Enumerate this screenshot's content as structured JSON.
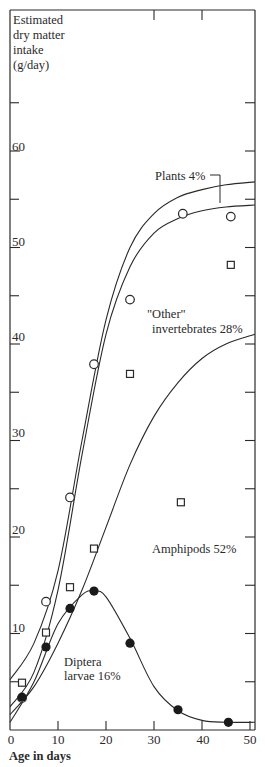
{
  "chart_data": {
    "type": "scatter",
    "title": "",
    "xlabel": "Age in days",
    "ylabel": "Estimated dry matter intake (g/day)",
    "ylabel_lines": [
      "Estimated",
      "dry matter",
      "intake",
      "(g/day)"
    ],
    "xlim": [
      0,
      51
    ],
    "ylim": [
      0,
      74
    ],
    "x_ticks": [
      0,
      10,
      20,
      30,
      40,
      50
    ],
    "y_ticks": [
      10,
      20,
      30,
      40,
      50,
      60
    ],
    "y_minor_ticks": [
      5,
      15,
      25,
      35,
      45,
      55,
      65
    ],
    "grid": false,
    "legend_position": "inline annotations",
    "series": [
      {
        "name": "Total (cumulative, incl. Plants)",
        "marker": "open-circle",
        "points": [
          [
            2.5,
            3.3
          ],
          [
            7.5,
            13.3
          ],
          [
            12.5,
            24.1
          ],
          [
            17.5,
            37.9
          ],
          [
            25,
            44.6
          ],
          [
            36,
            53.5
          ],
          [
            46,
            53.2
          ]
        ],
        "curve": [
          [
            0,
            5.2
          ],
          [
            5,
            9.0
          ],
          [
            10,
            16.5
          ],
          [
            15,
            30.0
          ],
          [
            20,
            42.5
          ],
          [
            25,
            50.0
          ],
          [
            30,
            53.5
          ],
          [
            35,
            55.2
          ],
          [
            40,
            56.0
          ],
          [
            45,
            56.5
          ],
          [
            51,
            56.8
          ]
        ]
      },
      {
        "name": "Cumulative excl. Plants",
        "marker": "none",
        "points": [],
        "curve": [
          [
            0,
            2.4
          ],
          [
            5,
            6.0
          ],
          [
            10,
            14.5
          ],
          [
            15,
            28.5
          ],
          [
            20,
            41.0
          ],
          [
            25,
            48.0
          ],
          [
            30,
            51.5
          ],
          [
            35,
            53.0
          ],
          [
            40,
            53.8
          ],
          [
            45,
            54.2
          ],
          [
            51,
            54.4
          ]
        ]
      },
      {
        "name": "Diptera + Amphipods (cumulative, open squares)",
        "marker": "open-square",
        "points": [
          [
            2.5,
            4.9
          ],
          [
            7.5,
            10.1
          ],
          [
            12.5,
            14.8
          ],
          [
            17.5,
            18.8
          ],
          [
            25,
            36.9
          ],
          [
            35.6,
            23.6
          ],
          [
            46,
            48.2
          ]
        ],
        "curve": [
          [
            0,
            1.6
          ],
          [
            5,
            4.5
          ],
          [
            10,
            9.0
          ],
          [
            15,
            14.5
          ],
          [
            20,
            21.0
          ],
          [
            25,
            27.5
          ],
          [
            30,
            32.5
          ],
          [
            35,
            36.0
          ],
          [
            40,
            38.5
          ],
          [
            45,
            40.0
          ],
          [
            51,
            41.0
          ]
        ]
      },
      {
        "name": "Diptera larvae",
        "marker": "filled-circle",
        "points": [
          [
            2.5,
            3.4
          ],
          [
            7.5,
            8.6
          ],
          [
            12.5,
            12.6
          ],
          [
            17.5,
            14.4
          ],
          [
            25,
            9.0
          ],
          [
            35,
            2.1
          ],
          [
            45.5,
            0.8
          ]
        ],
        "curve": [
          [
            0,
            0.8
          ],
          [
            5,
            5.0
          ],
          [
            10,
            11.0
          ],
          [
            15,
            14.0
          ],
          [
            17.5,
            14.4
          ],
          [
            20,
            13.8
          ],
          [
            25,
            9.5
          ],
          [
            30,
            4.5
          ],
          [
            35,
            2.0
          ],
          [
            40,
            1.0
          ],
          [
            45,
            0.8
          ],
          [
            51,
            0.8
          ]
        ]
      }
    ],
    "annotations": [
      {
        "text": "Plants 4%",
        "x": 36,
        "y": 60
      },
      {
        "text": "\"Other\"",
        "x": 27,
        "y": 43
      },
      {
        "text": "invertebrates 28%",
        "x": 28,
        "y": 41
      },
      {
        "text": "Amphipods 52%",
        "x": 27,
        "y": 17
      },
      {
        "text": "Diptera",
        "x": 8,
        "y": 6.5
      },
      {
        "text": "larvae 16%",
        "x": 8,
        "y": 4.3
      }
    ],
    "percent_shares": {
      "Plants": "4%",
      "\"Other\" invertebrates": "28%",
      "Amphipods": "52%",
      "Diptera larvae": "16%"
    }
  },
  "labels": {
    "ylabel_1": "Estimated",
    "ylabel_2": "dry matter",
    "ylabel_3": "intake",
    "ylabel_4": "(g/day)",
    "xlabel": "Age in days",
    "plants": "Plants 4%",
    "other_1": "\"Other\"",
    "other_2": "invertebrates 28%",
    "amphipods": "Amphipods 52%",
    "diptera_1": "Diptera",
    "diptera_2": "larvae 16%",
    "y10": "10",
    "y20": "20",
    "y30": "30",
    "y40": "40",
    "y50": "50",
    "y60": "60",
    "x0": "0",
    "x10": "10",
    "x20": "20",
    "x30": "30",
    "x40": "40",
    "x50": "50"
  },
  "colors": {
    "ink": "#2a2a2a",
    "background": "#ffffff"
  }
}
